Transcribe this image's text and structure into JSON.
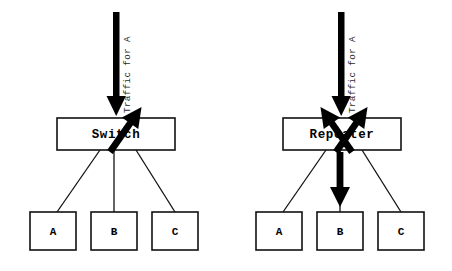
{
  "diagram": {
    "type": "network-comparison-diagram",
    "background_color": "#ffffff",
    "line_color": "#111111",
    "arrow_color": "#000000",
    "panels": [
      {
        "id": "switch-panel",
        "device_label": "Switch",
        "traffic_label": "Traffic for A",
        "hosts": [
          {
            "id": "host-a",
            "label": "A",
            "receives_traffic": true
          },
          {
            "id": "host-b",
            "label": "B",
            "receives_traffic": false
          },
          {
            "id": "host-c",
            "label": "C",
            "receives_traffic": false
          }
        ]
      },
      {
        "id": "repeater-panel",
        "device_label": "Repeater",
        "traffic_label": "Traffic for A",
        "hosts": [
          {
            "id": "host-a",
            "label": "A",
            "receives_traffic": true
          },
          {
            "id": "host-b",
            "label": "B",
            "receives_traffic": true
          },
          {
            "id": "host-c",
            "label": "C",
            "receives_traffic": true
          }
        ]
      }
    ]
  }
}
